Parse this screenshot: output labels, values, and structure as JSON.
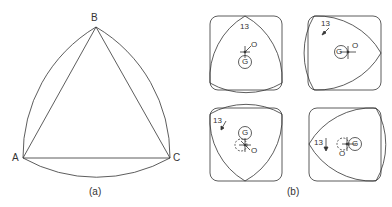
{
  "figure_a": {
    "caption": "(a)",
    "vertices": {
      "A": "A",
      "B": "B",
      "C": "C"
    }
  },
  "figure_b": {
    "caption": "(b)",
    "panels": [
      {
        "position": "top-left",
        "number": "13",
        "center_label": "G",
        "pivot_label": "O"
      },
      {
        "position": "top-right",
        "number": "13",
        "center_label": "G",
        "pivot_label": "O"
      },
      {
        "position": "bottom-left",
        "number": "13",
        "center_label": "G",
        "pivot_label": "O"
      },
      {
        "position": "bottom-right",
        "number": "13",
        "center_label": "G",
        "pivot_label": "O"
      }
    ]
  },
  "colors": {
    "stroke": "#333333",
    "background": "#ffffff"
  }
}
